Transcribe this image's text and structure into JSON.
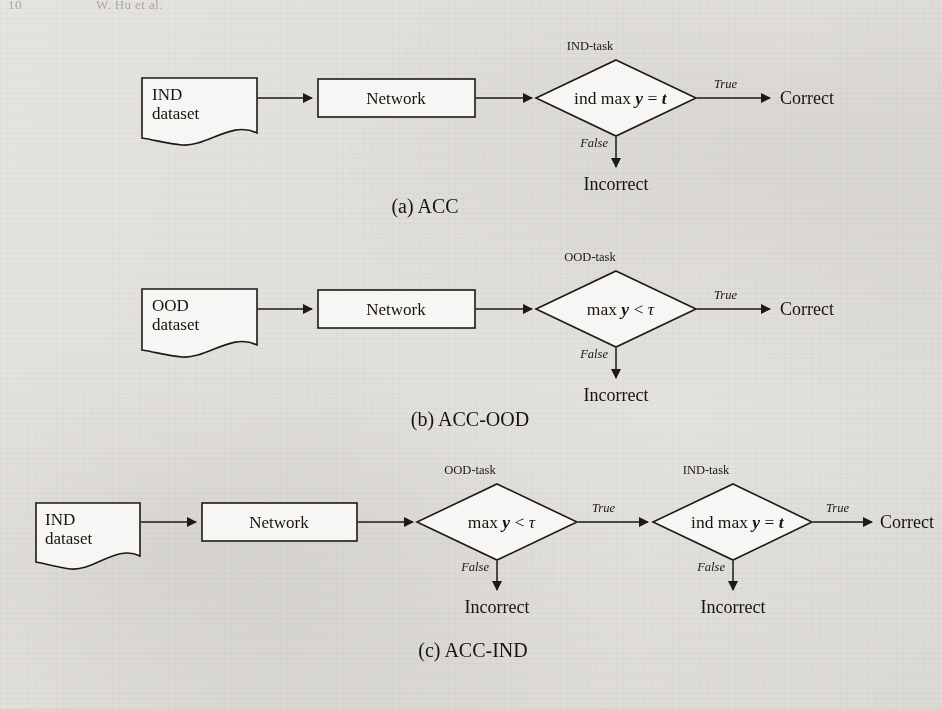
{
  "page": {
    "running_header": {
      "page_number": "10",
      "author_line": "W. Hu et al."
    },
    "background_color": "#f1f0ee",
    "ink_color": "#1d1915"
  },
  "figure": {
    "subfigures": [
      {
        "id": "acc",
        "caption": "(a) ACC",
        "nodes": {
          "dataset": {
            "line1": "IND",
            "line2": "dataset",
            "shape": "document"
          },
          "network": {
            "label": "Network",
            "shape": "rectangle"
          },
          "decision": {
            "task_label": "IND-task",
            "condition_plain": "ind max y = t",
            "parts": {
              "pre": "ind max ",
              "var": "y",
              "op": " = ",
              "rhs": "t"
            },
            "shape": "diamond"
          },
          "true_target": "Correct",
          "false_target": "Incorrect"
        },
        "edges": {
          "true_label": "True",
          "false_label": "False"
        }
      },
      {
        "id": "acc-ood",
        "caption": "(b) ACC-OOD",
        "nodes": {
          "dataset": {
            "line1": "OOD",
            "line2": "dataset",
            "shape": "document"
          },
          "network": {
            "label": "Network",
            "shape": "rectangle"
          },
          "decision": {
            "task_label": "OOD-task",
            "condition_plain": "max y < τ",
            "parts": {
              "pre": "max ",
              "var": "y",
              "op": " < ",
              "rhs": "τ"
            },
            "shape": "diamond"
          },
          "true_target": "Correct",
          "false_target": "Incorrect"
        },
        "edges": {
          "true_label": "True",
          "false_label": "False"
        }
      },
      {
        "id": "acc-ind",
        "caption": "(c) ACC-IND",
        "nodes": {
          "dataset": {
            "line1": "IND",
            "line2": "dataset",
            "shape": "document"
          },
          "network": {
            "label": "Network",
            "shape": "rectangle"
          },
          "decision1": {
            "task_label": "OOD-task",
            "condition_plain": "max y < τ",
            "parts": {
              "pre": "max ",
              "var": "y",
              "op": " < ",
              "rhs": "τ"
            },
            "shape": "diamond",
            "false_target": "Incorrect"
          },
          "decision2": {
            "task_label": "IND-task",
            "condition_plain": "ind max y = t",
            "parts": {
              "pre": "ind max ",
              "var": "y",
              "op": " = ",
              "rhs": "t"
            },
            "shape": "diamond",
            "false_target": "Incorrect"
          },
          "true_target": "Correct"
        },
        "edges": {
          "true_label": "True",
          "false_label": "False"
        }
      }
    ]
  }
}
